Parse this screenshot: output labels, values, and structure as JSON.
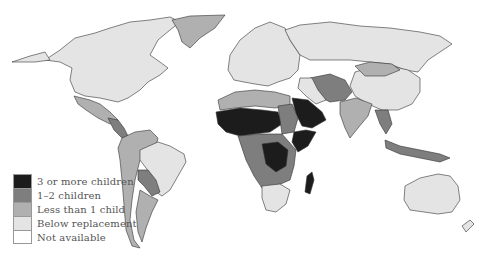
{
  "legend": {
    "items": [
      {
        "label": "3 or more children",
        "color": "#1c1c1c"
      },
      {
        "label": "1–2 children",
        "color": "#7e7e7e"
      },
      {
        "label": "Less than 1 child",
        "color": "#b0b0b0"
      },
      {
        "label": "Below replacement",
        "color": "#e4e4e4"
      },
      {
        "label": "Not available",
        "color": "#ffffff"
      }
    ]
  },
  "regions": {
    "north_america": "Below replacement",
    "greenland": "Less than 1 child",
    "mexico": "Less than 1 child",
    "central_america": "1–2 children",
    "brazil": "Below replacement",
    "andes": "Less than 1 child",
    "bolivia_paraguay": "1–2 children",
    "southern_cone": "Less than 1 child",
    "europe": "Below replacement",
    "russia": "Below replacement",
    "china": "Below replacement",
    "mongolia": "Less than 1 child",
    "central_asia": "1–2 children",
    "india": "Less than 1 child",
    "sahel_west_africa": "3 or more children",
    "arabian_peninsula": "3 or more children",
    "north_africa": "Less than 1 child",
    "central_africa": "1–2 children",
    "dr_congo": "3 or more children",
    "horn_of_africa": "3 or more children",
    "madagascar": "3 or more children",
    "southern_africa": "Below replacement",
    "southeast_asia": "1–2 children",
    "australia": "Below replacement"
  }
}
